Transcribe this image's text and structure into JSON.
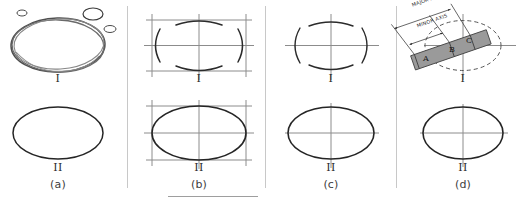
{
  "figure": {
    "background_color": "#ffffff",
    "ink_color": "#2b2b2b",
    "construction_color": "#8c8c8c",
    "strip_fill_color": "#9a9a9a",
    "divider_color": "#c8c8c8",
    "width": 526,
    "height": 204
  },
  "panels": [
    {
      "id": "a",
      "caption": "(a)",
      "method": "freehand-sketch",
      "steps": [
        {
          "label": "I",
          "description": "freehand trial strokes with small practice ellipses"
        },
        {
          "label": "II",
          "description": "finished ellipse"
        }
      ]
    },
    {
      "id": "b",
      "caption": "(b)",
      "method": "enclosing-rectangle",
      "steps": [
        {
          "label": "I",
          "description": "construction rectangle with centerlines and four tangent arcs"
        },
        {
          "label": "II",
          "description": "finished ellipse inscribed in rectangle"
        }
      ]
    },
    {
      "id": "c",
      "caption": "(c)",
      "method": "centerline-arcs",
      "steps": [
        {
          "label": "I",
          "description": "centerlines with four tangent arcs"
        },
        {
          "label": "II",
          "description": "finished ellipse on centerlines"
        }
      ]
    },
    {
      "id": "d",
      "caption": "(d)",
      "method": "trammel-paper-strip",
      "steps": [
        {
          "label": "I",
          "description": "paper strip trammel marked A, B, C against axes"
        },
        {
          "label": "II",
          "description": "finished ellipse"
        }
      ],
      "annotations": {
        "major_axis_label": "MAJOR AXIS",
        "minor_axis_label": "MINOR AXIS",
        "strip_marks": [
          "A",
          "B",
          "C"
        ]
      }
    }
  ],
  "dividers": [
    {
      "name": "divider-a-b"
    },
    {
      "name": "divider-b-c"
    },
    {
      "name": "divider-c-d"
    }
  ],
  "footer_rule": {
    "name": "footer-rule"
  }
}
